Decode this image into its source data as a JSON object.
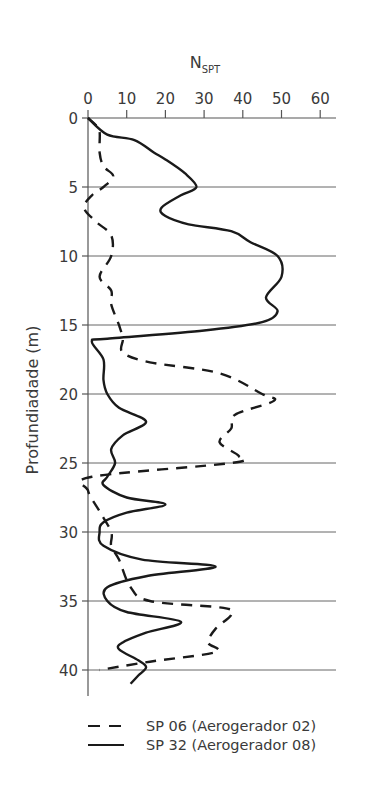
{
  "chart_data": {
    "type": "line",
    "orientation": "depth-profile (x on top, depth increasing downward)",
    "title": "",
    "xlabel": "N",
    "xlabel_subscript": "SPT",
    "ylabel": "Profundiadade (m)",
    "xlim": [
      0,
      63
    ],
    "ylim": [
      0,
      42
    ],
    "x_ticks": [
      0,
      10,
      20,
      30,
      40,
      50,
      60
    ],
    "y_ticks": [
      0,
      5,
      10,
      15,
      20,
      25,
      30,
      35,
      40
    ],
    "grid": "horizontal lines at each y tick",
    "legend_position": "bottom",
    "series": [
      {
        "name": "SP 06 (Aerogerador 02)",
        "style": "dashed",
        "color": "#1a1a1a",
        "points": [
          [
            0,
            0
          ],
          [
            2,
            0.5
          ],
          [
            3,
            1
          ],
          [
            3,
            2.5
          ],
          [
            4,
            3.5
          ],
          [
            6.5,
            4.2
          ],
          [
            4,
            5
          ],
          [
            1,
            5.6
          ],
          [
            -1,
            6.5
          ],
          [
            2,
            7.5
          ],
          [
            6,
            8.5
          ],
          [
            6,
            10
          ],
          [
            3,
            11.5
          ],
          [
            6,
            12.5
          ],
          [
            6,
            13.5
          ],
          [
            8,
            15
          ],
          [
            9,
            16
          ],
          [
            9,
            17
          ],
          [
            16,
            17.7
          ],
          [
            34,
            18.5
          ],
          [
            45,
            20
          ],
          [
            48,
            20.5
          ],
          [
            38,
            21.5
          ],
          [
            37,
            22.5
          ],
          [
            34,
            23.5
          ],
          [
            39,
            24.5
          ],
          [
            37,
            25
          ],
          [
            1,
            26
          ],
          [
            0,
            27
          ],
          [
            3,
            28.5
          ],
          [
            6,
            30
          ],
          [
            6,
            31
          ],
          [
            8,
            32
          ],
          [
            11,
            34
          ],
          [
            16,
            35
          ],
          [
            35,
            35.5
          ],
          [
            37,
            36
          ],
          [
            33,
            37
          ],
          [
            31,
            38
          ],
          [
            33,
            38.7
          ],
          [
            16,
            39.4
          ],
          [
            3,
            40
          ]
        ]
      },
      {
        "name": "SP 32 (Aerogerador 08)",
        "style": "solid",
        "color": "#1a1a1a",
        "points": [
          [
            0,
            0
          ],
          [
            5,
            1.2
          ],
          [
            12,
            1.6
          ],
          [
            17,
            2.5
          ],
          [
            20,
            3
          ],
          [
            25,
            4
          ],
          [
            28,
            5
          ],
          [
            24,
            5.6
          ],
          [
            19,
            6.5
          ],
          [
            20,
            7.1
          ],
          [
            26,
            7.7
          ],
          [
            37,
            8.2
          ],
          [
            42,
            9
          ],
          [
            49,
            10
          ],
          [
            50,
            11.5
          ],
          [
            46,
            13
          ],
          [
            49,
            14
          ],
          [
            45,
            14.8
          ],
          [
            30,
            15.4
          ],
          [
            5,
            16
          ],
          [
            1,
            16.2
          ],
          [
            4,
            17.5
          ],
          [
            4,
            19
          ],
          [
            5,
            20
          ],
          [
            8,
            21
          ],
          [
            15,
            22
          ],
          [
            9,
            23
          ],
          [
            6,
            24
          ],
          [
            7,
            25
          ],
          [
            5,
            26
          ],
          [
            4,
            26.6
          ],
          [
            10,
            27.5
          ],
          [
            20,
            28
          ],
          [
            10,
            28.6
          ],
          [
            4,
            29.3
          ],
          [
            3,
            30
          ],
          [
            4,
            31
          ],
          [
            14,
            32
          ],
          [
            33,
            32.5
          ],
          [
            15,
            33.2
          ],
          [
            5,
            34
          ],
          [
            5,
            35
          ],
          [
            10,
            35.8
          ],
          [
            24,
            36.5
          ],
          [
            15,
            37.3
          ],
          [
            9,
            38
          ],
          [
            8,
            38.5
          ],
          [
            13,
            39.3
          ],
          [
            15,
            39.8
          ],
          [
            13,
            40.4
          ],
          [
            11,
            41
          ]
        ]
      }
    ]
  },
  "legend": {
    "items": [
      {
        "label": "SP 06 (Aerogerador 02)",
        "style": "dashed"
      },
      {
        "label": "SP 32 (Aerogerador 08)",
        "style": "solid"
      }
    ]
  },
  "colors": {
    "line": "#1a1a1a",
    "axis": "#555555",
    "grid": "#666666",
    "text": "#3a3a3a"
  }
}
